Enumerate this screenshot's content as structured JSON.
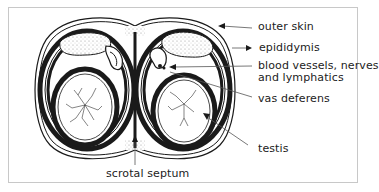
{
  "figure": {
    "type": "anatomical cross-section"
  },
  "labels": {
    "outer_skin": "outer skin",
    "epididymis": "epididymis",
    "blood_vessels_line1": "blood vessels, nerves",
    "blood_vessels_line2": "and lymphatics",
    "vas_deferens": "vas deferens",
    "testis": "testis",
    "scrotal_septum": "scrotal septum"
  },
  "colors": {
    "ink": "#1a1a1a",
    "leader": "#555555",
    "frame": "#c8c8c8",
    "stipple": "#9a9a9a"
  }
}
